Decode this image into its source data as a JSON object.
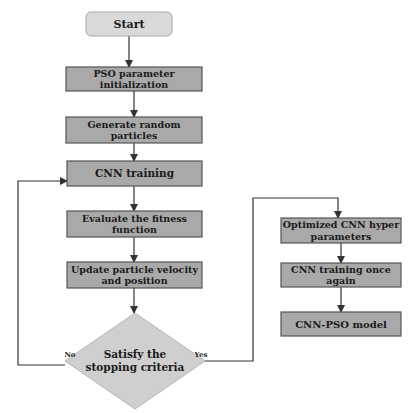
{
  "diagram": {
    "type": "flowchart",
    "colors": {
      "start_fill": "#d9d9d9",
      "process_fill": "#a9a9a9",
      "decision_fill": "#cfcfcf",
      "stroke": "#555555",
      "arrow": "#333333",
      "text": "#1a1a1a"
    },
    "nodes": [
      {
        "id": "start",
        "shape": "rounded-rect",
        "lines": [
          "Start"
        ]
      },
      {
        "id": "pso-init",
        "shape": "rect",
        "lines": [
          "PSO parameter",
          "initialization"
        ]
      },
      {
        "id": "gen-particles",
        "shape": "rect",
        "lines": [
          "Generate random",
          "particles"
        ]
      },
      {
        "id": "cnn-training",
        "shape": "rect",
        "lines": [
          "CNN training"
        ]
      },
      {
        "id": "eval-fitness",
        "shape": "rect",
        "lines": [
          "Evaluate the fitness",
          "function"
        ]
      },
      {
        "id": "update-particle",
        "shape": "rect",
        "lines": [
          "Update particle velocity",
          "and position"
        ]
      },
      {
        "id": "stopping-criteria",
        "shape": "diamond",
        "lines": [
          "Satisfy the",
          "stopping criteria"
        ]
      },
      {
        "id": "optimized-params",
        "shape": "rect",
        "lines": [
          "Optimized CNN hyper",
          "parameters"
        ]
      },
      {
        "id": "cnn-retrain",
        "shape": "rect",
        "lines": [
          "CNN training once",
          "again"
        ]
      },
      {
        "id": "cnn-pso-model",
        "shape": "rect",
        "lines": [
          "CNN-PSO model"
        ]
      }
    ],
    "edges": [
      {
        "from": "start",
        "to": "pso-init",
        "label": ""
      },
      {
        "from": "pso-init",
        "to": "gen-particles",
        "label": ""
      },
      {
        "from": "gen-particles",
        "to": "cnn-training",
        "label": ""
      },
      {
        "from": "cnn-training",
        "to": "eval-fitness",
        "label": ""
      },
      {
        "from": "eval-fitness",
        "to": "update-particle",
        "label": ""
      },
      {
        "from": "update-particle",
        "to": "stopping-criteria",
        "label": ""
      },
      {
        "from": "stopping-criteria",
        "to": "cnn-training",
        "label": "No"
      },
      {
        "from": "stopping-criteria",
        "to": "optimized-params",
        "label": "Yes"
      },
      {
        "from": "optimized-params",
        "to": "cnn-retrain",
        "label": ""
      },
      {
        "from": "cnn-retrain",
        "to": "cnn-pso-model",
        "label": ""
      }
    ]
  }
}
